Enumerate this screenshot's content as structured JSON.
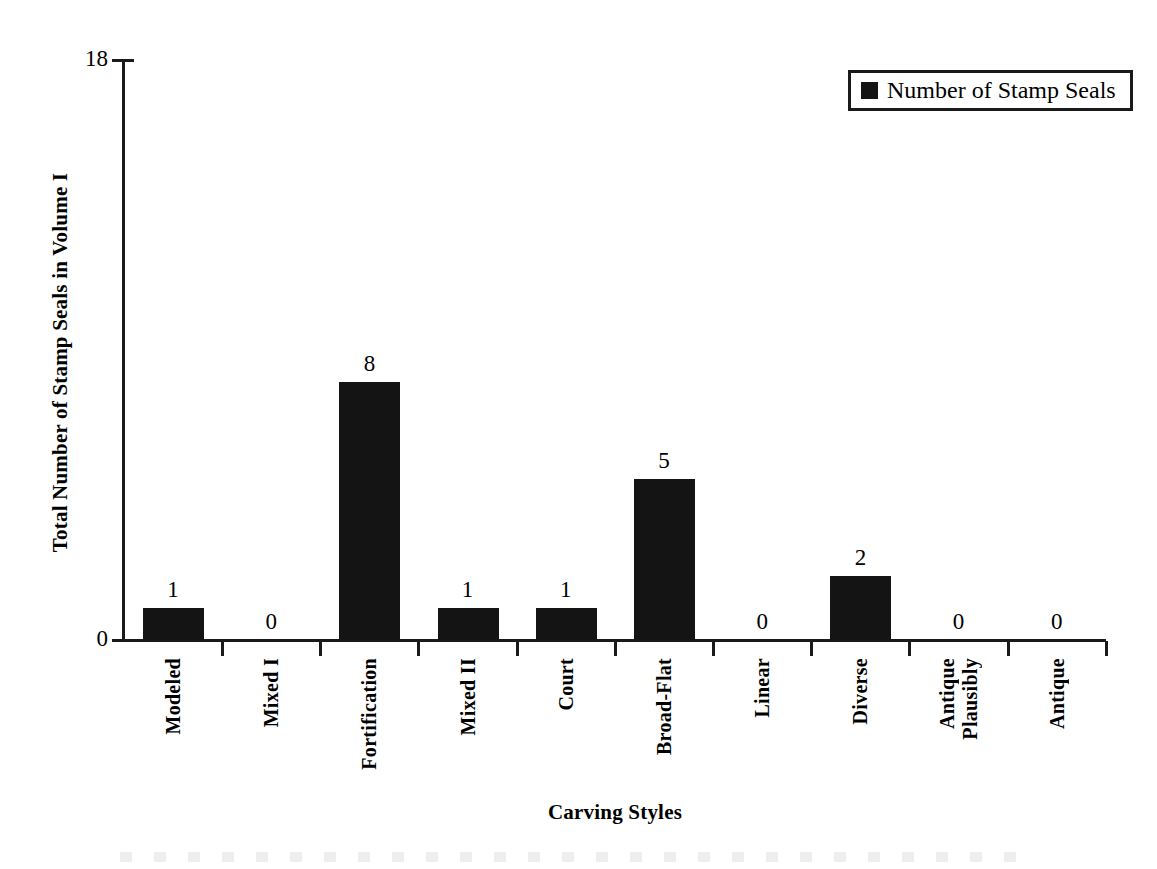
{
  "chart_data": {
    "type": "bar",
    "title": "",
    "categories": [
      "Modeled",
      "Mixed I",
      "Fortification",
      "Mixed II",
      "Court",
      "Broad-Flat",
      "Linear",
      "Diverse",
      "Plausibly Antique",
      "Antique"
    ],
    "values": [
      1,
      0,
      8,
      1,
      1,
      5,
      0,
      2,
      0,
      0
    ],
    "xlabel": "Carving Styles",
    "ylabel": "Total Number of Stamp Seals in Volume I",
    "ylim": [
      0,
      18
    ],
    "y_ticks": [
      "0",
      "18"
    ],
    "grid": false,
    "legend": {
      "position": "top-right",
      "entries": [
        {
          "label": "Number of Stamp Seals",
          "color": "#141414",
          "marker": "filled-square"
        }
      ]
    },
    "data_labels": [
      "1",
      "0",
      "8",
      "1",
      "1",
      "5",
      "0",
      "2",
      "0",
      "0"
    ],
    "bar_color": "#141414",
    "axis_color": "#1a1a1a"
  },
  "axis": {
    "y_title": "Total Number of Stamp Seals in Volume I",
    "x_title": "Carving Styles",
    "y_max_label": "18",
    "y_min_label": "0"
  },
  "legend": {
    "label": "Number of Stamp Seals"
  },
  "bars": [
    {
      "category": "Modeled",
      "value_label": "1",
      "words": [
        "Modeled"
      ]
    },
    {
      "category": "Mixed I",
      "value_label": "0",
      "words": [
        "Mixed I"
      ]
    },
    {
      "category": "Fortification",
      "value_label": "8",
      "words": [
        "Fortification"
      ]
    },
    {
      "category": "Mixed II",
      "value_label": "1",
      "words": [
        "Mixed II"
      ]
    },
    {
      "category": "Court",
      "value_label": "1",
      "words": [
        "Court"
      ]
    },
    {
      "category": "Broad-Flat",
      "value_label": "5",
      "words": [
        "Broad-Flat"
      ]
    },
    {
      "category": "Linear",
      "value_label": "0",
      "words": [
        "Linear"
      ]
    },
    {
      "category": "Diverse",
      "value_label": "2",
      "words": [
        "Diverse"
      ]
    },
    {
      "category": "Plausibly Antique",
      "value_label": "0",
      "words": [
        "Plausibly",
        "Antique"
      ]
    },
    {
      "category": "Antique",
      "value_label": "0",
      "words": [
        "Antique"
      ]
    }
  ]
}
